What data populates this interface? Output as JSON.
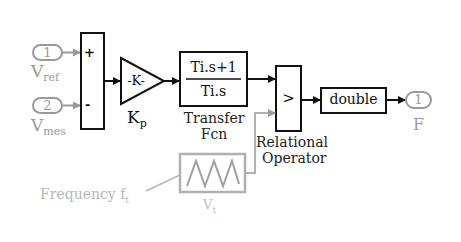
{
  "colors": {
    "main": "#111111",
    "grey": "#9a9a9a",
    "light_grey": "#b8b8b8"
  },
  "inports": [
    {
      "number": "1",
      "label_main": "V",
      "label_sub": "ref"
    },
    {
      "number": "2",
      "label_main": "V",
      "label_sub": "mes"
    }
  ],
  "sum": {
    "plus": "+",
    "minus": "-"
  },
  "gain": {
    "text": "-K-",
    "label_main": "K",
    "label_sub": "p"
  },
  "transfer_fcn": {
    "numerator": "Ti.s+1",
    "denominator": "Ti.s",
    "label_line1": "Transfer",
    "label_line2": "Fcn"
  },
  "relational": {
    "operator": ">",
    "label_line1": "Relational",
    "label_line2": "Operator"
  },
  "convert": {
    "text": "double"
  },
  "outport": {
    "number": "1",
    "label": "F"
  },
  "carrier": {
    "label_main": "V",
    "label_sub": "t",
    "annotation_main": "Frequency f",
    "annotation_sub": "t"
  }
}
